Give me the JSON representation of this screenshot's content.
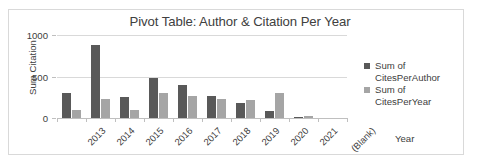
{
  "chart_data": {
    "type": "bar",
    "title": "Pivot Table: Author & Citation Per Year",
    "xlabel": "Year",
    "ylabel": "Sum Citation",
    "ylim": [
      0,
      1000
    ],
    "yticks": [
      "0",
      "500",
      "1000"
    ],
    "grid": true,
    "legend_position": "right",
    "categories": [
      "2013",
      "2014",
      "2015",
      "2016",
      "2017",
      "2018",
      "2019",
      "2020",
      "2021",
      "(Blank)"
    ],
    "series": [
      {
        "name": "Sum of CitesPerAuthor",
        "color": "#595959",
        "values": [
          300,
          875,
          255,
          480,
          400,
          260,
          185,
          85,
          10,
          0
        ]
      },
      {
        "name": "Sum of CitesPerYear",
        "color": "#a5a5a5",
        "values": [
          100,
          225,
          100,
          305,
          270,
          225,
          220,
          305,
          25,
          0
        ]
      }
    ]
  },
  "legend": {
    "items": [
      {
        "line1": "Sum of",
        "line2": "CitesPerAuthor"
      },
      {
        "line1": "Sum of",
        "line2": "CitesPerYear"
      }
    ]
  }
}
